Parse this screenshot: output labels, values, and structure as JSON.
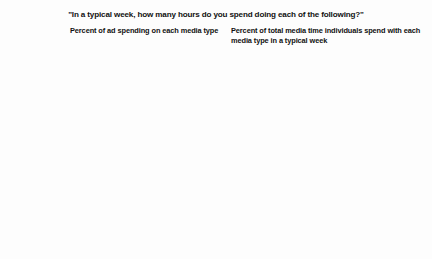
{
  "figure": {
    "title": "\"In a typical week, how many hours do you spend doing each of the following?\""
  },
  "legend": {
    "position": "center-middle",
    "items": [
      {
        "label": "2010",
        "color": "#161616",
        "key": "s2010"
      },
      {
        "label": "2009",
        "color": "#6e6e6e",
        "key": "s2009"
      },
      {
        "label": "2007",
        "color": "#b8b8b8",
        "key": "s2007"
      }
    ]
  },
  "panels": [
    {
      "heading": "Percent of ad spending on\neach media type",
      "categories": [
        "Watching TV",
        "Internet time\n(including\npersonal\nand work)",
        "Reading\nnewspapers",
        "Listening\nto the radio",
        "Reading\nmagazines"
      ],
      "rows": [
        {
          "values": [
            "41%",
            "31%",
            "31%"
          ]
        },
        {
          "values": [
            "18%",
            "12%",
            "8%"
          ]
        },
        {
          "values": [
            "12%",
            "14%",
            "18%"
          ]
        },
        {
          "values": [
            "9%",
            "7%",
            "8%"
          ]
        },
        {
          "values": [
            "5%",
            "5%",
            "6%"
          ]
        }
      ]
    },
    {
      "heading": "Percent of total media time individuals spend\nwith each media type in a typical week",
      "categories": [
        "",
        "",
        "",
        "",
        ""
      ],
      "rows": [
        {
          "values": [
            "31%",
            "35%",
            "37%"
          ]
        },
        {
          "values": [
            "33%",
            "34%",
            "29%"
          ]
        },
        {
          "values": [
            "6%",
            "7%",
            "8%"
          ]
        },
        {
          "values": [
            "15%",
            "18%",
            "19%"
          ]
        },
        {
          "values": [
            "5%",
            "6%",
            "7%"
          ]
        }
      ]
    }
  ],
  "chart_data": {
    "type": "bar",
    "title": "\"In a typical week, how many hours do you spend doing each of the following?\"",
    "orientation": "horizontal",
    "grid": false,
    "legend_position": "center",
    "series_names": [
      "2010",
      "2009",
      "2007"
    ],
    "series_colors": [
      "#161616",
      "#6e6e6e",
      "#b8b8b8"
    ],
    "categories": [
      "Watching TV",
      "Internet time (including personal and work)",
      "Reading newspapers",
      "Listening to the radio",
      "Reading magazines"
    ],
    "panels": [
      {
        "subtitle": "Percent of ad spending on each media type",
        "xlabel": "",
        "ylabel": "",
        "xlim": [
          0,
          41
        ],
        "units": "percent",
        "series": [
          {
            "name": "2010",
            "values": [
              41,
              18,
              12,
              9,
              5
            ]
          },
          {
            "name": "2009",
            "values": [
              31,
              12,
              14,
              7,
              5
            ]
          },
          {
            "name": "2007",
            "values": [
              31,
              8,
              18,
              8,
              6
            ]
          }
        ]
      },
      {
        "subtitle": "Percent of total media time individuals spend with each media type in a typical week",
        "xlabel": "",
        "ylabel": "",
        "xlim": [
          0,
          41
        ],
        "units": "percent",
        "series": [
          {
            "name": "2010",
            "values": [
              31,
              33,
              6,
              15,
              5
            ]
          },
          {
            "name": "2009",
            "values": [
              35,
              34,
              7,
              18,
              6
            ]
          },
          {
            "name": "2007",
            "values": [
              37,
              29,
              8,
              19,
              7
            ]
          }
        ]
      }
    ]
  }
}
